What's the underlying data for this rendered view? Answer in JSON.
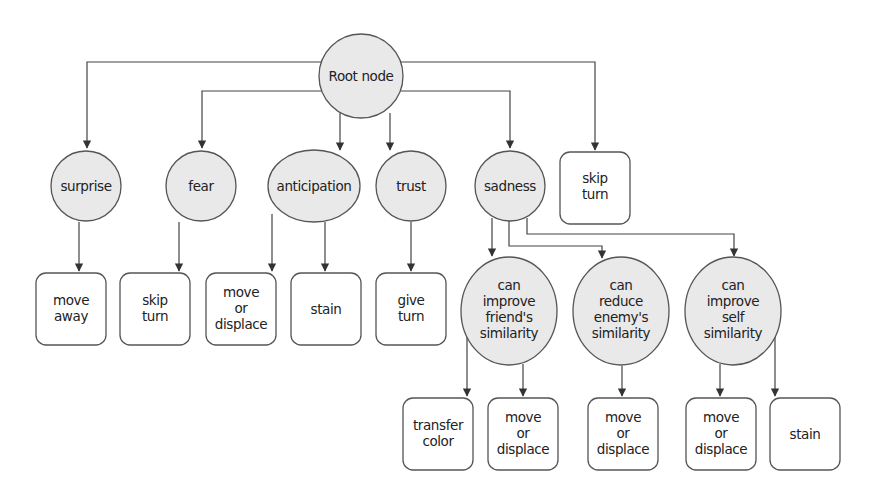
{
  "diagram": {
    "type": "decision-tree",
    "root": {
      "id": "root",
      "label": [
        "Root node"
      ]
    },
    "level1": [
      {
        "id": "surprise",
        "shape": "ellipse",
        "label": [
          "surprise"
        ]
      },
      {
        "id": "fear",
        "shape": "ellipse",
        "label": [
          "fear"
        ]
      },
      {
        "id": "anticipation",
        "shape": "ellipse",
        "label": [
          "anticipation"
        ]
      },
      {
        "id": "trust",
        "shape": "ellipse",
        "label": [
          "trust"
        ]
      },
      {
        "id": "sadness",
        "shape": "ellipse",
        "label": [
          "sadness"
        ]
      },
      {
        "id": "skip-turn-root",
        "shape": "box",
        "label": [
          "skip",
          "turn"
        ]
      }
    ],
    "level1_actions": [
      {
        "parent": "surprise",
        "label": [
          "move",
          "away"
        ]
      },
      {
        "parent": "fear",
        "label": [
          "skip",
          "turn"
        ]
      },
      {
        "parent": "anticipation",
        "label": [
          "move",
          "or",
          "displace"
        ]
      },
      {
        "parent": "anticipation",
        "label": [
          "stain"
        ]
      },
      {
        "parent": "trust",
        "label": [
          "give",
          "turn"
        ]
      }
    ],
    "sadness_conditions": [
      {
        "id": "friend",
        "label": [
          "can",
          "improve",
          "friend's",
          "similarity"
        ]
      },
      {
        "id": "enemy",
        "label": [
          "can",
          "reduce",
          "enemy's",
          "similarity"
        ]
      },
      {
        "id": "self",
        "label": [
          "can",
          "improve",
          "self",
          "similarity"
        ]
      }
    ],
    "condition_actions": [
      {
        "parent": "friend",
        "label": [
          "transfer",
          "color"
        ]
      },
      {
        "parent": "friend",
        "label": [
          "move",
          "or",
          "displace"
        ]
      },
      {
        "parent": "enemy",
        "label": [
          "move",
          "or",
          "displace"
        ]
      },
      {
        "parent": "self",
        "label": [
          "move",
          "or",
          "displace"
        ]
      },
      {
        "parent": "self",
        "label": [
          "stain"
        ]
      }
    ]
  },
  "colors": {
    "node_fill": "#e9e9e9",
    "stroke": "#555555",
    "background": "#ffffff"
  }
}
